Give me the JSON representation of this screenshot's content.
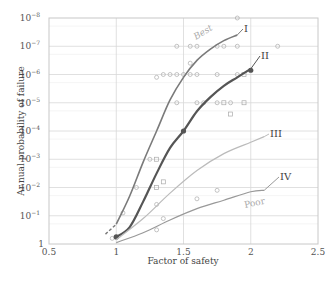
{
  "chart_data": {
    "type": "line",
    "title": "",
    "xlabel": "Factor of safety",
    "ylabel": "Ar.nual probability of failure",
    "xlim": [
      0.5,
      2.5
    ],
    "ylim_exponents": [
      0,
      -8
    ],
    "y_scale": "log",
    "x_ticks": [
      "0.5",
      "1",
      "1.5",
      "2",
      "2.5"
    ],
    "y_ticks": [
      {
        "base": "1",
        "exp": ""
      },
      {
        "base": "10",
        "exp": "−1"
      },
      {
        "base": "10",
        "exp": "−2"
      },
      {
        "base": "10",
        "exp": "−3"
      },
      {
        "base": "10",
        "exp": "−4"
      },
      {
        "base": "10",
        "exp": "−5"
      },
      {
        "base": "10",
        "exp": "−6"
      },
      {
        "base": "10",
        "exp": "−7"
      },
      {
        "base": "10",
        "exp": "−8"
      }
    ],
    "grid": true,
    "annotations": [
      "Best",
      "Poor"
    ],
    "series": [
      {
        "name": "I",
        "color": "#7a7a7a",
        "width": 1.6,
        "x": [
          1.0,
          1.1,
          1.2,
          1.3,
          1.4,
          1.5,
          1.6,
          1.7,
          1.8,
          1.9
        ],
        "exponents": [
          -0.7,
          -1.7,
          -2.9,
          -4.0,
          -5.1,
          -5.9,
          -6.5,
          -6.9,
          -7.2,
          -7.4
        ],
        "dashed_extension": {
          "x": [
            0.92,
            1.0
          ],
          "exponents": [
            -0.35,
            -0.7
          ]
        }
      },
      {
        "name": "II",
        "color": "#555555",
        "width": 2.2,
        "x": [
          1.0,
          1.1,
          1.2,
          1.3,
          1.4,
          1.5,
          1.6,
          1.7,
          1.8,
          1.9,
          2.0
        ],
        "exponents": [
          -0.25,
          -0.6,
          -1.5,
          -2.5,
          -3.4,
          -4.0,
          -4.7,
          -5.2,
          -5.6,
          -5.9,
          -6.2
        ],
        "markers": [
          {
            "x": 1.0,
            "e": -0.25
          },
          {
            "x": 1.5,
            "e": -4.0
          },
          {
            "x": 2.0,
            "e": -6.15
          }
        ]
      },
      {
        "name": "III",
        "color": "#bbbbbb",
        "width": 1.2,
        "x": [
          1.0,
          1.2,
          1.4,
          1.6,
          1.8,
          2.0,
          2.1
        ],
        "exponents": [
          -0.15,
          -0.9,
          -1.8,
          -2.6,
          -3.2,
          -3.6,
          -3.8
        ]
      },
      {
        "name": "IV",
        "color": "#999999",
        "width": 1.2,
        "x": [
          1.0,
          1.2,
          1.4,
          1.6,
          1.8,
          2.0,
          2.1
        ],
        "exponents": [
          -0.05,
          -0.4,
          -0.85,
          -1.25,
          -1.55,
          -1.85,
          -1.9
        ]
      }
    ],
    "scatter_points": [
      {
        "x": 1.9,
        "e": -8.0,
        "shape": "circle"
      },
      {
        "x": 1.45,
        "e": -7.0,
        "shape": "circle"
      },
      {
        "x": 1.55,
        "e": -7.0,
        "shape": "circle"
      },
      {
        "x": 1.6,
        "e": -7.0,
        "shape": "circle"
      },
      {
        "x": 1.75,
        "e": -7.0,
        "shape": "circle"
      },
      {
        "x": 1.8,
        "e": -7.0,
        "shape": "circle"
      },
      {
        "x": 1.9,
        "e": -7.0,
        "shape": "circle"
      },
      {
        "x": 2.2,
        "e": -7.0,
        "shape": "circle"
      },
      {
        "x": 1.55,
        "e": -6.4,
        "shape": "circle"
      },
      {
        "x": 1.35,
        "e": -6.0,
        "shape": "circle"
      },
      {
        "x": 1.4,
        "e": -6.0,
        "shape": "circle"
      },
      {
        "x": 1.45,
        "e": -6.0,
        "shape": "circle"
      },
      {
        "x": 1.5,
        "e": -6.0,
        "shape": "circle"
      },
      {
        "x": 1.55,
        "e": -6.0,
        "shape": "circle"
      },
      {
        "x": 1.6,
        "e": -6.0,
        "shape": "circle"
      },
      {
        "x": 1.75,
        "e": -6.0,
        "shape": "circle"
      },
      {
        "x": 1.9,
        "e": -6.0,
        "shape": "circle"
      },
      {
        "x": 1.95,
        "e": -6.0,
        "shape": "square"
      },
      {
        "x": 1.6,
        "e": -5.0,
        "shape": "circle"
      },
      {
        "x": 1.65,
        "e": -5.0,
        "shape": "circle"
      },
      {
        "x": 1.75,
        "e": -5.0,
        "shape": "circle"
      },
      {
        "x": 1.8,
        "e": -5.0,
        "shape": "square"
      },
      {
        "x": 1.85,
        "e": -5.0,
        "shape": "circle"
      },
      {
        "x": 1.95,
        "e": -5.0,
        "shape": "square"
      },
      {
        "x": 1.85,
        "e": -4.6,
        "shape": "square"
      },
      {
        "x": 1.3,
        "e": -5.9,
        "shape": "circle"
      },
      {
        "x": 1.25,
        "e": -3.0,
        "shape": "circle"
      },
      {
        "x": 1.3,
        "e": -3.0,
        "shape": "square"
      },
      {
        "x": 1.45,
        "e": -5.0,
        "shape": "circle"
      },
      {
        "x": 1.15,
        "e": -2.0,
        "shape": "circle"
      },
      {
        "x": 1.05,
        "e": -1.1,
        "shape": "circle"
      },
      {
        "x": 1.3,
        "e": -2.0,
        "shape": "square"
      },
      {
        "x": 1.35,
        "e": -2.2,
        "shape": "square"
      },
      {
        "x": 1.3,
        "e": -1.4,
        "shape": "circle"
      },
      {
        "x": 1.35,
        "e": -0.9,
        "shape": "circle"
      },
      {
        "x": 1.75,
        "e": -1.9,
        "shape": "circle"
      },
      {
        "x": 1.6,
        "e": -1.6,
        "shape": "circle"
      },
      {
        "x": 1.3,
        "e": -0.5,
        "shape": "circle"
      },
      {
        "x": 0.97,
        "e": -0.2,
        "shape": "circle"
      }
    ]
  }
}
